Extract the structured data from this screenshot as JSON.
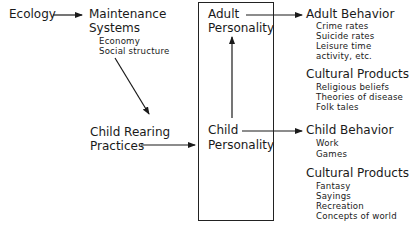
{
  "diagram": {
    "nodes": {
      "ecology": {
        "label": "Ecology"
      },
      "maintenance": {
        "line1": "Maintenance",
        "line2": "Systems",
        "items": [
          "Economy",
          "Social structure"
        ]
      },
      "child_rearing": {
        "line1": "Child Rearing",
        "line2": "Practices"
      },
      "adult_personality": {
        "line1": "Adult",
        "line2": "Personality"
      },
      "child_personality": {
        "line1": "Child",
        "line2": "Personality"
      },
      "adult_behavior": {
        "label": "Adult Behavior",
        "items": [
          "Crime rates",
          "Suicide rates",
          "Leisure time",
          "activity, etc."
        ]
      },
      "cultural_products_1": {
        "label": "Cultural Products",
        "items": [
          "Religious beliefs",
          "Theories of disease",
          "Folk tales"
        ]
      },
      "child_behavior": {
        "label": "Child Behavior",
        "items": [
          "Work",
          "Games"
        ]
      },
      "cultural_products_2": {
        "label": "Cultural Products",
        "items": [
          "Fantasy",
          "Sayings",
          "Recreation",
          "Concepts of world"
        ]
      }
    },
    "edges": [
      {
        "from": "Ecology",
        "to": "Maintenance Systems"
      },
      {
        "from": "Maintenance Systems",
        "to": "Child Rearing Practices"
      },
      {
        "from": "Child Rearing Practices",
        "to": "Personality box"
      },
      {
        "from": "Child Personality",
        "to": "Adult Personality"
      },
      {
        "from": "Adult Personality",
        "to": "Adult Behavior"
      },
      {
        "from": "Child Personality",
        "to": "Child Behavior"
      }
    ],
    "colors": {
      "ink": "#1a1a1a",
      "background": "#ffffff"
    }
  }
}
